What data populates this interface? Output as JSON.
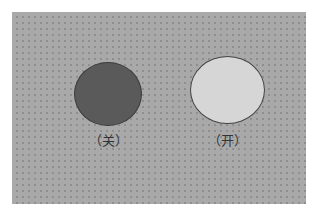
{
  "diagram": {
    "background_color": "#a9a9a9",
    "lamps": [
      {
        "state": "off",
        "label": "（关）",
        "fill": "#5a5a5a"
      },
      {
        "state": "on",
        "label": "（开）",
        "fill": "#d6d6d6"
      }
    ]
  }
}
